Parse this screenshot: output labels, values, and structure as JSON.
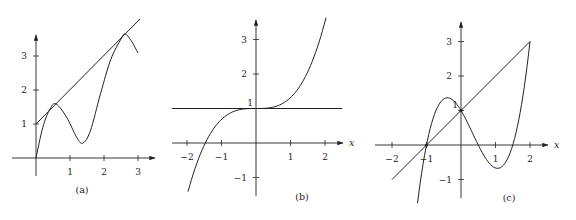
{
  "chart_data": [
    {
      "type": "line",
      "panel_label": "(a)",
      "xlabel": "",
      "ylabel": "",
      "xticks": [
        1,
        2,
        3
      ],
      "yticks": [
        1,
        2,
        3
      ],
      "xtick_labels": [
        "1",
        "2",
        "3"
      ],
      "ytick_labels": [
        "1",
        "2",
        "3"
      ],
      "xlim": [
        -0.5,
        3.5
      ],
      "ylim": [
        -0.6,
        3.6
      ],
      "grid": false,
      "series": [
        {
          "name": "tangent line y = x + 1",
          "x": [
            0,
            3.06
          ],
          "y": [
            1,
            4.06
          ]
        },
        {
          "name": "curve",
          "x": [
            0,
            0.2,
            0.41,
            0.59,
            0.9,
            1.2,
            1.38,
            1.6,
            1.9,
            2.2,
            2.5,
            2.62,
            2.8,
            3.0
          ],
          "y": [
            0,
            0.9,
            1.44,
            1.59,
            1.2,
            0.6,
            0.44,
            0.8,
            1.9,
            2.9,
            3.5,
            3.65,
            3.45,
            3.09
          ]
        }
      ]
    },
    {
      "type": "line",
      "panel_label": "(b)",
      "xlabel": "x",
      "ylabel": "",
      "xticks": [
        -2,
        -1,
        1,
        2
      ],
      "yticks": [
        -1,
        1,
        2,
        3
      ],
      "xtick_labels": [
        "−2",
        "−1",
        "1",
        "2"
      ],
      "ytick_labels": [
        "−1",
        "1",
        "2",
        "3"
      ],
      "xlim": [
        -2.5,
        2.5
      ],
      "ylim": [
        -1.7,
        3.7
      ],
      "grid": false,
      "series": [
        {
          "name": "horizontal tangent y = 1",
          "x": [
            -2.5,
            2.5
          ],
          "y": [
            1,
            1
          ]
        },
        {
          "name": "curve y = 1 + 0.315x^3",
          "x": [
            -1.97,
            -1.5,
            -1.0,
            -0.5,
            0,
            0.5,
            1.0,
            1.5,
            2.03
          ],
          "y": [
            -1.41,
            -0.06,
            0.69,
            0.96,
            1.0,
            1.04,
            1.32,
            2.06,
            3.64
          ]
        }
      ]
    },
    {
      "type": "line",
      "panel_label": "(c)",
      "xlabel": "x",
      "ylabel": "",
      "xticks": [
        -2,
        -1,
        1,
        2
      ],
      "yticks": [
        -1,
        1,
        2,
        3
      ],
      "xtick_labels": [
        "−2",
        "−1",
        "1",
        "2"
      ],
      "ytick_labels": [
        "−1",
        "1",
        "2",
        "3"
      ],
      "xlim": [
        -2.5,
        2.5
      ],
      "ylim": [
        -1.7,
        3.7
      ],
      "grid": false,
      "series": [
        {
          "name": "line y = x + 1",
          "x": [
            -2,
            2
          ],
          "y": [
            -1,
            3
          ]
        },
        {
          "name": "cubic y = x + 1 + (4/3)x(x+1)(x-2)",
          "x": [
            -1.26,
            -1,
            -0.5,
            0,
            0.47,
            1.06,
            1.47,
            2
          ],
          "y": [
            -1.68,
            0,
            1.33,
            1,
            0,
            -0.66,
            0,
            3
          ]
        }
      ]
    }
  ],
  "panels": [
    {
      "label": "(a)",
      "origin": [
        36,
        158
      ],
      "unit": 34,
      "xaxis": {
        "from": 12,
        "to": 155,
        "arrow": true,
        "name": ""
      },
      "yaxis": {
        "from": 176,
        "to": 35,
        "arrow": true
      },
      "xticks": [
        {
          "v": 1,
          "t": "1"
        },
        {
          "v": 2,
          "t": "2"
        },
        {
          "v": 3,
          "t": "3"
        }
      ],
      "yticks": [
        {
          "v": 1,
          "t": "1"
        },
        {
          "v": 2,
          "t": "2"
        },
        {
          "v": 3,
          "t": "3"
        }
      ],
      "lines": [
        {
          "x1": 0,
          "y1": 1,
          "x2": 3.06,
          "y2": 4.09
        }
      ],
      "curve": {
        "kind": "a",
        "x0": 0,
        "x1": 3.0
      },
      "dots": [],
      "label_pos": [
        82,
        193
      ]
    },
    {
      "label": "(b)",
      "origin": [
        256,
        143
      ],
      "unit": 34.5,
      "xaxis": {
        "from": 172,
        "to": 343,
        "arrow": true,
        "name": "x"
      },
      "yaxis": {
        "from": 196,
        "to": 20,
        "arrow": true
      },
      "xticks": [
        {
          "v": -2,
          "t": "−2"
        },
        {
          "v": -1,
          "t": "−1"
        },
        {
          "v": 1,
          "t": "1"
        },
        {
          "v": 2,
          "t": "2"
        }
      ],
      "yticks": [
        {
          "v": -1,
          "t": "−1"
        },
        {
          "v": 1,
          "t": "1"
        },
        {
          "v": 2,
          "t": "2"
        },
        {
          "v": 3,
          "t": "3"
        }
      ],
      "lines": [
        {
          "x1": -2.43,
          "y1": 1,
          "x2": 2.5,
          "y2": 1
        }
      ],
      "curve": {
        "kind": "b",
        "x0": -1.97,
        "x1": 2.03
      },
      "dots": [],
      "label_pos": [
        302,
        200
      ]
    },
    {
      "label": "(c)",
      "origin": [
        461,
        145
      ],
      "unit": 34.5,
      "xaxis": {
        "from": 375,
        "to": 548,
        "arrow": true,
        "name": "x"
      },
      "yaxis": {
        "from": 198,
        "to": 22,
        "arrow": true
      },
      "xticks": [
        {
          "v": -2,
          "t": "−2"
        },
        {
          "v": -1,
          "t": "−1"
        },
        {
          "v": 1,
          "t": "1"
        },
        {
          "v": 2,
          "t": "2"
        }
      ],
      "yticks": [
        {
          "v": -1,
          "t": "−1"
        },
        {
          "v": 1,
          "t": "1"
        },
        {
          "v": 2,
          "t": "2"
        },
        {
          "v": 3,
          "t": "3"
        }
      ],
      "lines": [
        {
          "x1": -2,
          "y1": -1,
          "x2": 2,
          "y2": 3
        }
      ],
      "curve": {
        "kind": "c",
        "x0": -1.26,
        "x1": 2.0
      },
      "dots": [
        [
          -1,
          0
        ],
        [
          0,
          1
        ]
      ],
      "label_pos": [
        509,
        201
      ]
    }
  ],
  "colors": {
    "ink": "#222222",
    "background": "#ffffff"
  }
}
